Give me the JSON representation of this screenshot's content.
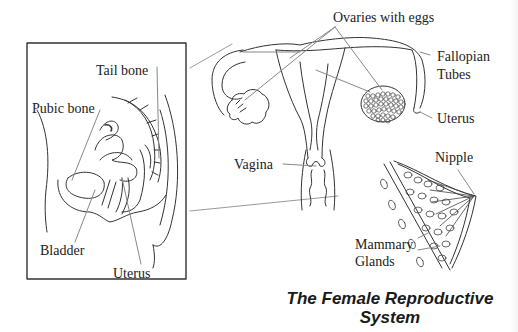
{
  "title": {
    "line1": "The Female Reproductive",
    "line2": "System"
  },
  "side_view": {
    "labels": {
      "tail_bone": "Tail bone",
      "pubic_bone": "Pubic bone",
      "bladder": "Bladder",
      "uterus": "Uterus"
    }
  },
  "front_view": {
    "labels": {
      "ovaries": "Ovaries with eggs",
      "fallopian_line1": "Fallopian",
      "fallopian_line2": "Tubes",
      "uterus": "Uterus",
      "vagina": "Vagina"
    }
  },
  "breast_view": {
    "labels": {
      "nipple": "Nipple",
      "mammary_line1": "Mammary",
      "mammary_line2": "Glands"
    }
  },
  "colors": {
    "line": "#333333",
    "leader": "#888888",
    "background": "#ffffff"
  }
}
